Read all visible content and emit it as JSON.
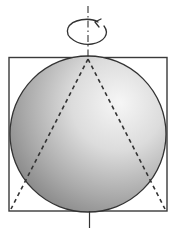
{
  "diagram": {
    "elements": [
      {
        "id": "rotation-axis",
        "type": "dash-dot-line",
        "label": ""
      },
      {
        "id": "rotation-arrow",
        "type": "curved-arrow",
        "direction": "counter-clockwise"
      },
      {
        "id": "cylinder-outline",
        "type": "rectangle"
      },
      {
        "id": "sphere",
        "type": "shaded-circle"
      },
      {
        "id": "cone",
        "type": "dashed-triangle"
      }
    ],
    "colors": {
      "stroke": "#3a3a3a",
      "sphere_highlight": "#f4f4f4",
      "sphere_mid": "#c4c4c4",
      "sphere_shadow": "#7e7e7e",
      "background": "#ffffff"
    }
  }
}
